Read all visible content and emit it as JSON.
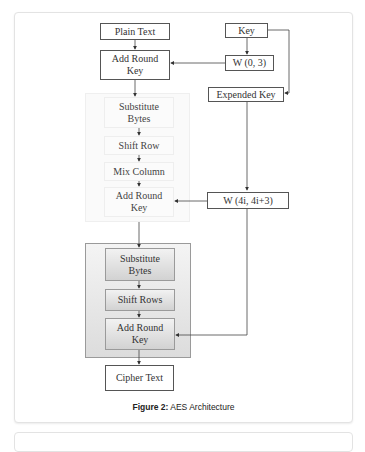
{
  "figure": {
    "caption_label": "Figure 2:",
    "caption_text": " AES Architecture"
  },
  "nodes": {
    "plain_text": "Plain Text",
    "add_round_key_initial": "Add Round Key",
    "key": "Key",
    "w_0_3": "W (0, 3)",
    "expanded_key": "Expended Key",
    "substitute_bytes_round": "Substitute Bytes",
    "shift_row": "Shift Row",
    "mix_column": "Mix Column",
    "add_round_key_round": "Add Round Key",
    "w_4i_4i3": "W (4i, 4i+3)",
    "substitute_bytes_final": "Substitute Bytes",
    "shift_rows_final": "Shift Rows",
    "add_round_key_final": "Add Round Key",
    "cipher_text": "Cipher Text"
  },
  "edges": [
    {
      "from": "plain_text",
      "to": "add_round_key_initial"
    },
    {
      "from": "key",
      "to": "w_0_3"
    },
    {
      "from": "w_0_3",
      "to": "add_round_key_initial"
    },
    {
      "from": "key",
      "to": "expanded_key"
    },
    {
      "from": "add_round_key_initial",
      "to": "substitute_bytes_round"
    },
    {
      "from": "substitute_bytes_round",
      "to": "shift_row"
    },
    {
      "from": "shift_row",
      "to": "mix_column"
    },
    {
      "from": "mix_column",
      "to": "add_round_key_round"
    },
    {
      "from": "expanded_key",
      "to": "w_4i_4i3"
    },
    {
      "from": "w_4i_4i3",
      "to": "add_round_key_round"
    },
    {
      "from": "add_round_key_round",
      "to": "substitute_bytes_final"
    },
    {
      "from": "substitute_bytes_final",
      "to": "shift_rows_final"
    },
    {
      "from": "shift_rows_final",
      "to": "add_round_key_final"
    },
    {
      "from": "w_4i_4i3",
      "to": "add_round_key_final"
    },
    {
      "from": "add_round_key_final",
      "to": "cipher_text"
    }
  ]
}
